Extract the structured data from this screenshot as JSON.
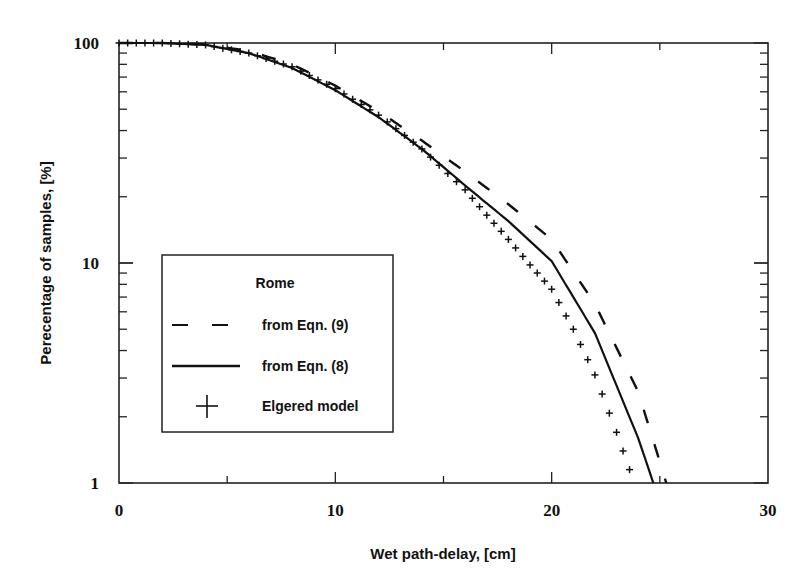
{
  "chart_data": {
    "type": "line",
    "title": "",
    "xlabel": "Wet path-delay, [cm]",
    "ylabel": "Perecentage of samples, [%]",
    "xlim": [
      0,
      30
    ],
    "ylim": [
      1,
      100
    ],
    "yscale": "log",
    "x_ticks": [
      0,
      10,
      20,
      30
    ],
    "x_tick_labels": [
      "0",
      "10",
      "20",
      "30"
    ],
    "y_ticks": [
      1,
      10,
      100
    ],
    "y_tick_labels": [
      "1",
      "10",
      "100"
    ],
    "grid": false,
    "legend": {
      "title": "Rome",
      "position": "lower left",
      "entries": [
        {
          "label": "from Eqn. (9)",
          "style": "dashed"
        },
        {
          "label": "from Eqn. (8)",
          "style": "solid"
        },
        {
          "label": "Elgered model",
          "style": "plus-markers"
        }
      ]
    },
    "series": [
      {
        "name": "from Eqn. (9)",
        "style": "dashed",
        "x": [
          0,
          2,
          4,
          6,
          8,
          10,
          12,
          14,
          16,
          18,
          20,
          22,
          24,
          25.3
        ],
        "y": [
          100,
          100,
          98.5,
          92,
          80,
          64,
          49,
          36,
          26,
          18.5,
          12.8,
          6.5,
          2.6,
          1.0
        ]
      },
      {
        "name": "from Eqn. (8)",
        "style": "solid",
        "x": [
          0,
          2,
          4,
          6,
          8,
          10,
          12,
          14,
          16,
          18,
          20,
          22,
          24,
          24.7
        ],
        "y": [
          100,
          100,
          98,
          90,
          77,
          61,
          46,
          33,
          22.5,
          15.5,
          10.2,
          4.8,
          1.6,
          1.0
        ]
      },
      {
        "name": "Elgered model",
        "style": "plus-markers",
        "x": [
          0,
          2,
          4,
          6,
          8,
          10,
          12,
          14,
          16,
          17,
          18,
          19,
          20,
          21,
          22,
          23,
          23.6
        ],
        "y": [
          100,
          100,
          98,
          90,
          78,
          62,
          47,
          33,
          21.5,
          16.5,
          12.8,
          9.8,
          7.6,
          5.0,
          3.1,
          1.7,
          1.15
        ]
      }
    ]
  }
}
